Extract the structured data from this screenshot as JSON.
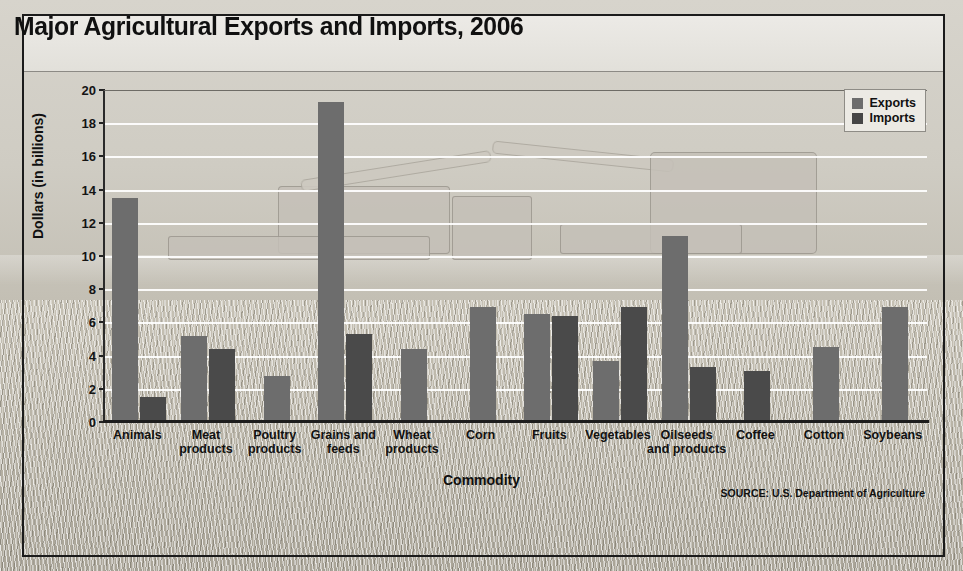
{
  "chart_data": {
    "type": "bar",
    "title": "Major Agricultural Exports and Imports, 2006",
    "xlabel": "Commodity",
    "ylabel": "Dollars (in billions)",
    "ylim": [
      0,
      20
    ],
    "ytick_step": 2,
    "yticks": [
      0,
      2,
      4,
      6,
      8,
      10,
      12,
      14,
      16,
      18,
      20
    ],
    "grid": true,
    "legend_position": "top-right",
    "categories": [
      "Animals",
      "Meat products",
      "Poultry products",
      "Grains and feeds",
      "Wheat products",
      "Corn",
      "Fruits",
      "Vegetables",
      "Oilseeds and products",
      "Coffee",
      "Cotton",
      "Soybeans"
    ],
    "series": [
      {
        "name": "Exports",
        "color": "#6d6d6d",
        "values": [
          13.5,
          5.2,
          2.8,
          19.3,
          4.4,
          6.9,
          6.5,
          3.7,
          11.2,
          null,
          4.5,
          6.9
        ]
      },
      {
        "name": "Imports",
        "color": "#4a4a4a",
        "values": [
          1.5,
          4.4,
          null,
          5.3,
          null,
          null,
          6.4,
          6.9,
          3.3,
          3.1,
          null,
          null
        ]
      }
    ],
    "source": "SOURCE: U.S. Department of Agriculture"
  },
  "header": {
    "title": "Major Agricultural Exports and Imports, 2006"
  },
  "legend": {
    "items": [
      {
        "label": "Exports"
      },
      {
        "label": "Imports"
      }
    ]
  },
  "axes": {
    "y_title": "Dollars (in billions)",
    "x_title": "Commodity",
    "y_labels": [
      "20",
      "18",
      "16",
      "14",
      "12",
      "10",
      "8",
      "6",
      "4",
      "2",
      "0"
    ]
  },
  "categories_display": [
    {
      "line1": "Animals",
      "line2": ""
    },
    {
      "line1": "Meat",
      "line2": "products"
    },
    {
      "line1": "Poultry",
      "line2": "products"
    },
    {
      "line1": "Grains and",
      "line2": "feeds"
    },
    {
      "line1": "Wheat",
      "line2": "products"
    },
    {
      "line1": "Corn",
      "line2": ""
    },
    {
      "line1": "Fruits",
      "line2": ""
    },
    {
      "line1": "Vegetables",
      "line2": ""
    },
    {
      "line1": "Oilseeds",
      "line2": "and products"
    },
    {
      "line1": "Coffee",
      "line2": ""
    },
    {
      "line1": "Cotton",
      "line2": ""
    },
    {
      "line1": "Soybeans",
      "line2": ""
    }
  ],
  "footer": {
    "source": "SOURCE: U.S. Department of Agriculture"
  },
  "colors": {
    "exports": "#6d6d6d",
    "imports": "#4a4a4a",
    "frame": "#1b1b1b",
    "title_band": "#eceae6"
  }
}
